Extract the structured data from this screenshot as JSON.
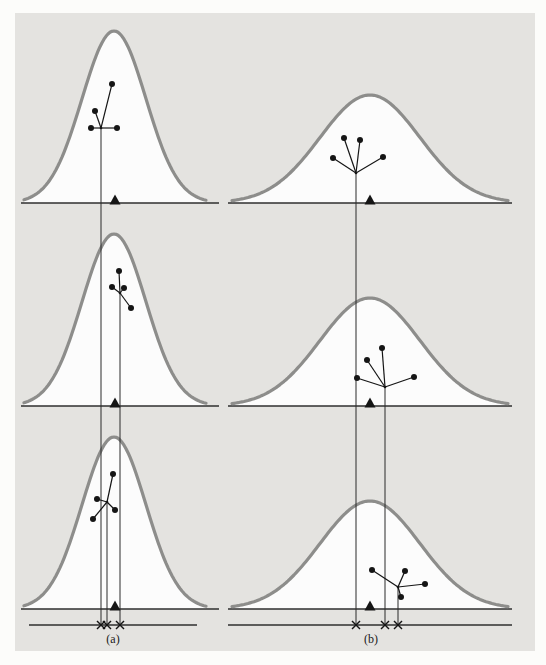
{
  "figure": {
    "page_bg": "#fcfcfa",
    "panel_bg": "#e4e3e0",
    "panel_rect": {
      "x": 15,
      "y": 13,
      "w": 520,
      "h": 638
    },
    "colors": {
      "curve_stroke": "#8d8d8b",
      "curve_fill": "#fcfcfc",
      "axis": "#2f2f2f",
      "ink": "#151515",
      "vline": "#2a2a2a",
      "label": "#1a1a1a"
    },
    "columns": [
      {
        "id": "a",
        "label": "(a)",
        "curve": {
          "center_x": 114,
          "sigma": 32,
          "height": 172,
          "x0": 24,
          "x1": 206
        },
        "baseline": {
          "x0": 21,
          "x1": 219
        },
        "bottom_axis": {
          "x0": 29,
          "x1": 197,
          "y": 625
        },
        "triangle_x": 115,
        "rows": [
          {
            "baseline_y": 203,
            "star": {
              "center": [
                101,
                128
              ],
              "points": [
                [
                  112,
                  84
                ],
                [
                  95,
                  111
                ],
                [
                  91,
                  128
                ],
                [
                  117,
                  128
                ]
              ]
            }
          },
          {
            "baseline_y": 406,
            "star": {
              "center": [
                120,
                293
              ],
              "points": [
                [
                  119,
                  271
                ],
                [
                  112,
                  287
                ],
                [
                  124,
                  288
                ],
                [
                  131,
                  308
                ]
              ]
            }
          },
          {
            "baseline_y": 609,
            "star": {
              "center": [
                107,
                502
              ],
              "points": [
                [
                  113,
                  474
                ],
                [
                  97,
                  499
                ],
                [
                  93,
                  519
                ],
                [
                  115,
                  510
                ]
              ]
            }
          }
        ]
      },
      {
        "id": "b",
        "label": "(b)",
        "curve": {
          "center_x": 370,
          "sigma": 50,
          "height": 108,
          "x0": 232,
          "x1": 508
        },
        "baseline": {
          "x0": 228,
          "x1": 512
        },
        "bottom_axis": {
          "x0": 228,
          "x1": 512,
          "y": 625
        },
        "triangle_x": 370,
        "rows": [
          {
            "baseline_y": 203,
            "star": {
              "center": [
                356,
                173
              ],
              "points": [
                [
                  344,
                  138
                ],
                [
                  360,
                  140
                ],
                [
                  333,
                  158
                ],
                [
                  383,
                  157
                ]
              ]
            }
          },
          {
            "baseline_y": 406,
            "star": {
              "center": [
                385,
                387
              ],
              "points": [
                [
                  382,
                  348
                ],
                [
                  367,
                  360
                ],
                [
                  357,
                  378
                ],
                [
                  414,
                  377
                ]
              ]
            }
          },
          {
            "baseline_y": 609,
            "star": {
              "center": [
                398,
                587
              ],
              "points": [
                [
                  372,
                  570
                ],
                [
                  405,
                  571
                ],
                [
                  425,
                  584
                ],
                [
                  401,
                  597
                ]
              ]
            }
          }
        ]
      }
    ]
  }
}
